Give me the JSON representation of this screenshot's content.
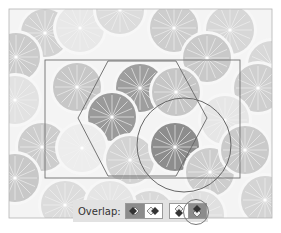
{
  "toolbar": {
    "label": "Overlap:",
    "groups": [
      {
        "name": "stacking-order",
        "buttons": [
          {
            "name": "front-stacking-button",
            "icon": "stack-front-icon",
            "active": true
          },
          {
            "name": "back-stacking-button",
            "icon": "stack-back-icon",
            "active": false
          }
        ]
      },
      {
        "name": "vertical-order",
        "buttons": [
          {
            "name": "bottom-on-top-button",
            "icon": "stack-bottom-top-icon",
            "active": false
          },
          {
            "name": "top-on-top-button",
            "icon": "stack-top-bottom-icon",
            "active": true
          }
        ]
      }
    ]
  },
  "canvas": {
    "frame": {
      "x": 9,
      "y": 9,
      "w": 263,
      "h": 209
    },
    "tile_rect": {
      "x": 45,
      "y": 60,
      "w": 195,
      "h": 118
    },
    "hexagon": "108,61 176,61 207,118 176,176 108,176 78,118",
    "selection_circle": {
      "cx": 184,
      "cy": 145,
      "r": 47
    },
    "colors": {
      "slice_dark": "#8e8e8e",
      "slice_mid": "#b4b4b4",
      "slice_light": "#cfcfcf",
      "slice_pale": "#e4e4e4",
      "rind": "#f5f5f5",
      "outline": "#6a6a6a"
    }
  }
}
